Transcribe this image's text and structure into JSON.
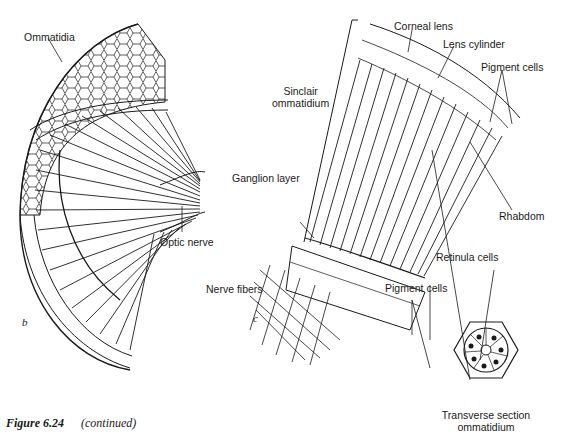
{
  "figure": {
    "caption_number": "Figure 6.24",
    "caption_text": "(continued)"
  },
  "panel_b": {
    "letter": "b",
    "labels": {
      "ommatidia": "Ommatidia",
      "optic_nerve": "Optic nerve"
    }
  },
  "panel_c": {
    "letter": "c",
    "labels": {
      "corneal_lens": "Corneal lens",
      "lens_cylinder": "Lens cylinder",
      "pigment_cells_top": "Pigment cells",
      "sinclair_line1": "Sinclair",
      "sinclair_line2": "ommatidium",
      "ganglion_layer": "Ganglion layer",
      "rhabdom": "Rhabdom",
      "retinula_cells": "Retinula cells",
      "pigment_cells_bottom": "Pigment cells",
      "nerve_fibers": "Nerve fibers"
    }
  },
  "transverse_section": {
    "label_line1": "Transverse section",
    "label_line2": "ommatidium"
  },
  "colors": {
    "ink": "#1a1a1a",
    "paper": "#ffffff"
  }
}
